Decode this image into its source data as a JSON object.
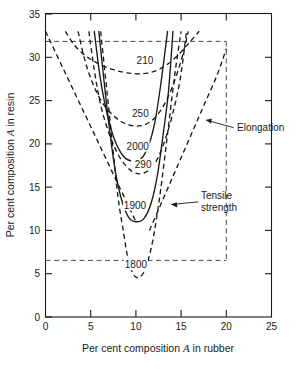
{
  "chart_data": {
    "type": "line",
    "title": "",
    "xlabel": "Per cent composition A in rubber",
    "ylabel": "Per cent composition A in resin",
    "xlim": [
      0,
      25
    ],
    "ylim": [
      0,
      35
    ],
    "xticks": [
      0,
      5,
      10,
      15,
      20,
      25
    ],
    "yticks": [
      0,
      5,
      10,
      15,
      20,
      25,
      30,
      35
    ],
    "xtick_labels": [
      "0",
      "5",
      "10",
      "15",
      "20",
      "25"
    ],
    "ytick_labels": [
      "0",
      "5",
      "10",
      "15",
      "20",
      "25",
      "30",
      "35"
    ],
    "grid": false,
    "legend": "none",
    "series": [
      {
        "name": "1800",
        "label": "1800",
        "style": "dashed",
        "property": "elongation",
        "label_xy": [
          10.0,
          5.8
        ],
        "points": [
          [
            6.1,
            33.0
          ],
          [
            6.8,
            26.0
          ],
          [
            7.4,
            20.0
          ],
          [
            8.0,
            14.0
          ],
          [
            8.6,
            10.0
          ],
          [
            9.2,
            6.4
          ],
          [
            10.0,
            4.6
          ],
          [
            10.9,
            5.2
          ],
          [
            11.7,
            8.0
          ],
          [
            12.3,
            11.5
          ],
          [
            12.9,
            16.0
          ],
          [
            13.6,
            22.0
          ],
          [
            14.3,
            28.0
          ],
          [
            15.0,
            33.0
          ]
        ]
      },
      {
        "name": "1900",
        "label": "1900",
        "style": "solid",
        "property": "tensile-strength",
        "label_xy": [
          9.9,
          12.7
        ],
        "points": [
          [
            5.9,
            33.0
          ],
          [
            6.5,
            27.0
          ],
          [
            7.1,
            21.5
          ],
          [
            7.7,
            17.0
          ],
          [
            8.4,
            13.6
          ],
          [
            9.2,
            11.5
          ],
          [
            10.0,
            11.0
          ],
          [
            10.9,
            11.4
          ],
          [
            11.7,
            13.2
          ],
          [
            12.4,
            16.5
          ],
          [
            13.0,
            21.0
          ],
          [
            13.6,
            26.0
          ],
          [
            14.1,
            33.0
          ]
        ]
      },
      {
        "name": "2000",
        "label": "2000",
        "style": "solid",
        "property": "tensile-strength",
        "label_xy": [
          10.2,
          19.5
        ],
        "points": [
          [
            5.4,
            33.0
          ],
          [
            6.0,
            28.0
          ],
          [
            6.7,
            24.0
          ],
          [
            7.6,
            20.6
          ],
          [
            8.6,
            18.6
          ],
          [
            9.6,
            18.0
          ],
          [
            10.6,
            18.3
          ],
          [
            11.4,
            19.8
          ],
          [
            12.1,
            22.5
          ],
          [
            12.7,
            26.5
          ],
          [
            13.2,
            30.5
          ],
          [
            13.5,
            33.0
          ]
        ]
      },
      {
        "name": "290",
        "label": "290",
        "style": "dashed",
        "property": "elongation",
        "label_xy": [
          10.8,
          17.4
        ],
        "points": [
          [
            4.8,
            33.0
          ],
          [
            5.4,
            28.5
          ],
          [
            6.1,
            24.5
          ],
          [
            7.1,
            21.0
          ],
          [
            8.3,
            18.3
          ],
          [
            9.6,
            16.8
          ],
          [
            10.8,
            16.6
          ],
          [
            12.0,
            17.6
          ],
          [
            13.0,
            19.8
          ],
          [
            14.0,
            23.2
          ],
          [
            14.9,
            27.5
          ],
          [
            15.6,
            33.0
          ]
        ]
      },
      {
        "name": "250",
        "label": "250",
        "style": "dashed",
        "property": "elongation",
        "label_xy": [
          10.5,
          23.3
        ],
        "points": [
          [
            3.6,
            33.0
          ],
          [
            4.4,
            29.5
          ],
          [
            5.3,
            26.8
          ],
          [
            6.4,
            24.6
          ],
          [
            7.8,
            23.0
          ],
          [
            9.2,
            22.2
          ],
          [
            10.6,
            22.1
          ],
          [
            11.9,
            22.8
          ],
          [
            13.0,
            24.3
          ],
          [
            14.0,
            26.5
          ],
          [
            15.0,
            29.6
          ],
          [
            15.8,
            33.0
          ]
        ]
      },
      {
        "name": "210",
        "label": "210",
        "style": "dashed",
        "property": "elongation",
        "label_xy": [
          11.0,
          29.4
        ],
        "points": [
          [
            2.2,
            33.0
          ],
          [
            3.2,
            31.4
          ],
          [
            4.4,
            30.2
          ],
          [
            5.8,
            29.3
          ],
          [
            7.4,
            28.6
          ],
          [
            9.0,
            28.2
          ],
          [
            10.6,
            28.1
          ],
          [
            12.1,
            28.4
          ],
          [
            13.5,
            29.2
          ],
          [
            14.8,
            30.4
          ],
          [
            16.0,
            31.8
          ],
          [
            17.0,
            33.0
          ]
        ]
      },
      {
        "name": "elongation-left-boundary",
        "label": "",
        "style": "dashed",
        "property": "elongation",
        "points": [
          [
            0.0,
            33.0
          ],
          [
            2.0,
            28.6
          ],
          [
            4.0,
            24.2
          ],
          [
            6.0,
            19.8
          ],
          [
            8.0,
            15.4
          ],
          [
            9.2,
            12.8
          ],
          [
            10.0,
            11.0
          ]
        ]
      },
      {
        "name": "elongation-right-boundary",
        "label": "",
        "style": "dashed",
        "property": "elongation",
        "points": [
          [
            11.5,
            10.0
          ],
          [
            13.0,
            13.6
          ],
          [
            14.5,
            17.2
          ],
          [
            16.0,
            20.8
          ],
          [
            17.5,
            24.4
          ],
          [
            19.0,
            28.0
          ],
          [
            20.0,
            31.0
          ]
        ]
      }
    ],
    "annotations": [
      {
        "name": "elongation-annotation",
        "text": "Elongation",
        "text_xy": [
          21.3,
          21.0
        ],
        "arrow_from": [
          20.8,
          21.2
        ],
        "arrow_to": [
          17.7,
          22.0
        ]
      },
      {
        "name": "tensile-strength-annotation",
        "text_line1": "Tensile",
        "text_line2": "strength",
        "text_xy": [
          17.2,
          13.4
        ],
        "arrow_from": [
          16.9,
          13.3
        ],
        "arrow_to": [
          13.9,
          13.0
        ]
      }
    ],
    "reference_box": {
      "name": "dashed-reference-box",
      "top_y": 33,
      "bottom_y": 10,
      "right_x": 20,
      "left_x": 0
    }
  }
}
